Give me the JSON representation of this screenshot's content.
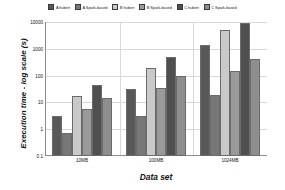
{
  "chart_data": {
    "type": "bar",
    "title": "",
    "subtitle": "",
    "xlabel": "Data set",
    "ylabel": "Execution time - log scale (s)",
    "yscale": "log",
    "ylim": [
      0.1,
      10000
    ],
    "ytick_labels": [
      "10000",
      "1000",
      "100",
      "10",
      "1",
      "0.1"
    ],
    "ytick_values": [
      10000,
      1000,
      100,
      10,
      1,
      0.1
    ],
    "grid": true,
    "legend_position": "top",
    "categories": [
      "10MB",
      "100MB",
      "1024MB"
    ],
    "series": [
      {
        "name": "A hubert",
        "color": "#595959",
        "values": [
          3,
          33,
          1400
        ]
      },
      {
        "name": "A Spark-based",
        "color": "#777777",
        "values": [
          0.7,
          3,
          19
        ]
      },
      {
        "name": "B hubert",
        "color": "#c9c9c9",
        "values": [
          18,
          190,
          5200
        ]
      },
      {
        "name": "B Spark-based",
        "color": "#9a9a9a",
        "values": [
          5.5,
          34,
          150
        ]
      },
      {
        "name": "C hubert",
        "color": "#4f4f4f",
        "values": [
          45,
          480,
          9000
        ]
      },
      {
        "name": "C Spark-based",
        "color": "#8e8e8e",
        "values": [
          14,
          100,
          430
        ]
      }
    ]
  },
  "legend": {
    "items": [
      {
        "label": "A hubert"
      },
      {
        "label": "A Spark-based"
      },
      {
        "label": "B hubert"
      },
      {
        "label": "B Spark-based"
      },
      {
        "label": "C hubert"
      },
      {
        "label": "C Spark-based"
      }
    ]
  },
  "axes": {
    "y_title": "Execution time - log scale (s)",
    "x_title": "Data set"
  }
}
